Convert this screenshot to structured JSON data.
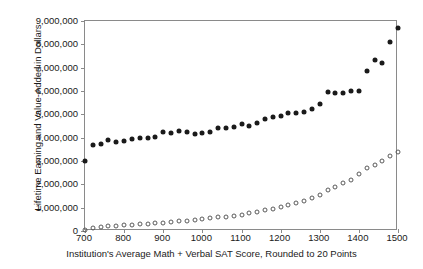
{
  "chart_data": {
    "type": "scatter",
    "title": "",
    "xlabel": "Institution's Average Math + Verbal SAT Score, Rounded to 20 Points",
    "ylabel": "Lifetime Earning and Value-Added in Dollars",
    "xlim": [
      700,
      1500
    ],
    "ylim": [
      0,
      9000000
    ],
    "xticks": [
      700,
      800,
      900,
      1000,
      1100,
      1200,
      1300,
      1400,
      1500
    ],
    "xtick_labels": [
      "700",
      "800",
      "900",
      "1000",
      "1100",
      "1200",
      "1300",
      "1400",
      "1500"
    ],
    "yticks": [
      0,
      1000000,
      2000000,
      3000000,
      4000000,
      5000000,
      6000000,
      7000000,
      8000000,
      9000000
    ],
    "ytick_labels": [
      "0",
      "1,000,000",
      "2,000,000",
      "3,000,000",
      "4,000,000",
      "5,000,000",
      "6,000,000",
      "7,000,000",
      "8,000,000",
      "9,000,000"
    ],
    "grid": false,
    "legend": "none",
    "x": [
      700,
      720,
      740,
      760,
      780,
      800,
      820,
      840,
      860,
      880,
      900,
      920,
      940,
      960,
      980,
      1000,
      1020,
      1040,
      1060,
      1080,
      1100,
      1120,
      1140,
      1160,
      1180,
      1200,
      1220,
      1240,
      1260,
      1280,
      1300,
      1320,
      1340,
      1360,
      1380,
      1400,
      1420,
      1440,
      1460,
      1480,
      1500
    ],
    "series": [
      {
        "name": "Lifetime Earnings",
        "marker": "filled-circle",
        "color": "#1a1a1a",
        "values": [
          3000000,
          3700000,
          3750000,
          3900000,
          3800000,
          3850000,
          3950000,
          4000000,
          4000000,
          4050000,
          4250000,
          4200000,
          4300000,
          4250000,
          4150000,
          4200000,
          4250000,
          4400000,
          4400000,
          4450000,
          4600000,
          4500000,
          4650000,
          4800000,
          4900000,
          4950000,
          5050000,
          5050000,
          5100000,
          5250000,
          5450000,
          5950000,
          5900000,
          5900000,
          6000000,
          6000000,
          6850000,
          7350000,
          7200000,
          8100000,
          8700000
        ]
      },
      {
        "name": "Value-Added",
        "marker": "open-circle",
        "color": "#5a5a5a",
        "values": [
          40000,
          130000,
          170000,
          200000,
          220000,
          240000,
          260000,
          280000,
          300000,
          330000,
          350000,
          380000,
          410000,
          440000,
          470000,
          500000,
          540000,
          580000,
          620000,
          660000,
          700000,
          760000,
          820000,
          880000,
          950000,
          1020000,
          1100000,
          1200000,
          1300000,
          1420000,
          1560000,
          1750000,
          1900000,
          2050000,
          2200000,
          2450000,
          2700000,
          2850000,
          3000000,
          3200000,
          3400000
        ]
      }
    ]
  }
}
